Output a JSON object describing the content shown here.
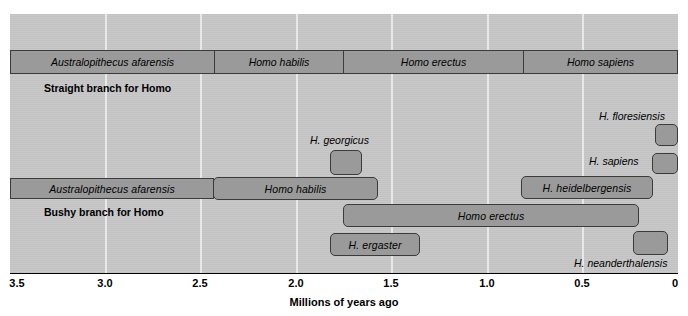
{
  "figure": {
    "width": 688,
    "height": 316,
    "panel": {
      "left": 10,
      "top": 14,
      "width": 668,
      "height": 259
    },
    "colors": {
      "panel_background": "#c9c9c9",
      "gridline": "#e8e8e8",
      "bar_fill": "#9a9a9a",
      "bar_border": "#3b3b3b",
      "text": "#000000",
      "axis": "#000000"
    }
  },
  "axis": {
    "title": "Millions of years ago",
    "orientation": "reversed",
    "min": 0,
    "max": 3.5,
    "ticks": [
      {
        "label": "3.5",
        "value": 3.5,
        "x": 10
      },
      {
        "label": "3.0",
        "value": 3.0,
        "x": 105
      },
      {
        "label": "2.5",
        "value": 2.5,
        "x": 200
      },
      {
        "label": "2.0",
        "value": 2.0,
        "x": 296
      },
      {
        "label": "1.5",
        "value": 1.5,
        "x": 391
      },
      {
        "label": "1.0",
        "value": 1.0,
        "x": 487
      },
      {
        "label": "0.5",
        "value": 0.5,
        "x": 582
      },
      {
        "label": "0",
        "value": 0.0,
        "x": 678
      }
    ],
    "gridlines_x": [
      105,
      200,
      296,
      391,
      487,
      582
    ]
  },
  "branches": [
    {
      "id": "straight",
      "caption": "Straight branch for Homo",
      "caption_x": 44,
      "caption_y": 82,
      "strip": {
        "x": 10,
        "y": 50,
        "width": 668,
        "height": 24,
        "segments": [
          {
            "name": "Australopithecus afarensis",
            "start": 3.5,
            "end": 2.44,
            "width": 204
          },
          {
            "name": "Homo habilis",
            "start": 2.44,
            "end": 1.76,
            "width": 129
          },
          {
            "name": "Homo erectus",
            "start": 1.76,
            "end": 0.81,
            "width": 180
          },
          {
            "name": "Homo sapiens",
            "start": 0.81,
            "end": 0.0,
            "width": 155
          }
        ]
      }
    },
    {
      "id": "bushy",
      "caption": "Bushy branch for Homo",
      "caption_x": 44,
      "caption_y": 206,
      "bars": [
        {
          "name": "H. georgicus",
          "label_inside": false,
          "external_label": "H. georgicus",
          "label_x": 310,
          "label_y": 136,
          "label_align": "left",
          "x": 330,
          "y": 150,
          "width": 32,
          "height": 25,
          "start": 1.86,
          "end": 1.69
        },
        {
          "name": "H. floresiensis",
          "label_inside": false,
          "external_label": "H. floresiensis",
          "label_x": 600,
          "label_y": 110,
          "label_align": "left",
          "x": 655,
          "y": 124,
          "width": 23,
          "height": 22,
          "start": 0.12,
          "end": 0.0
        },
        {
          "name": "H. sapiens",
          "label_inside": false,
          "external_label": "H. sapiens",
          "label_x": 589,
          "label_y": 156,
          "label_align": "left",
          "x": 652,
          "y": 153,
          "width": 26,
          "height": 21,
          "start": 0.14,
          "end": 0.0
        },
        {
          "name": "Australopithecus afarensis",
          "label_inside": true,
          "x": 10,
          "y": 178,
          "width": 204,
          "height": 21,
          "start": 3.5,
          "end": 2.44
        },
        {
          "name": "Homo habilis",
          "label_inside": true,
          "x": 214,
          "y": 178,
          "width": 164,
          "height": 21,
          "start": 2.44,
          "end": 1.58
        },
        {
          "name": "H. heidelbergensis",
          "label_inside": true,
          "x": 521,
          "y": 176,
          "width": 132,
          "height": 22,
          "start": 0.71,
          "end": 0.13
        },
        {
          "name": "Homo erectus",
          "label_inside": true,
          "x": 343,
          "y": 204,
          "width": 296,
          "height": 22,
          "start": 1.75,
          "end": 0.2
        },
        {
          "name": "H. ergaster",
          "label_inside": true,
          "x": 330,
          "y": 233,
          "width": 90,
          "height": 22,
          "start": 1.82,
          "end": 1.35
        },
        {
          "name": "H. neanderthalensis",
          "label_inside": false,
          "external_label": "H. neanderthalensis",
          "label_x": 574,
          "label_y": 258,
          "label_align": "left",
          "x": 633,
          "y": 232,
          "width": 35,
          "height": 24,
          "start": 0.24,
          "end": 0.05
        }
      ]
    }
  ]
}
